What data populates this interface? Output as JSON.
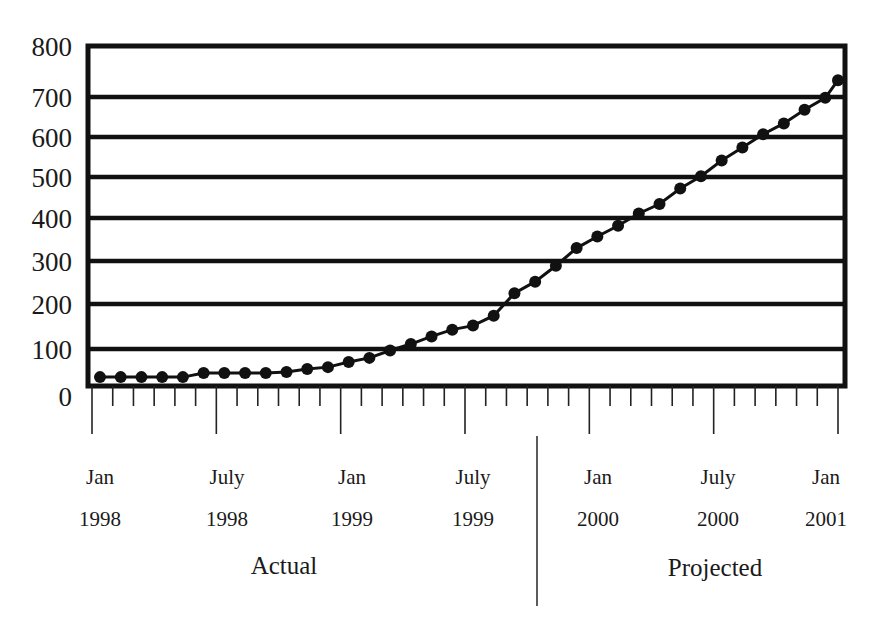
{
  "chart_data": {
    "type": "line",
    "title": "",
    "title_note": "Title cropped at top edge; illegible",
    "xlabel": "",
    "ylabel": "",
    "ylim": [
      0,
      800
    ],
    "yticks": [
      0,
      100,
      200,
      300,
      400,
      500,
      600,
      700,
      800
    ],
    "grid": "horizontal",
    "legend": null,
    "x_major_labels": [
      {
        "line1": "Jan",
        "line2": "1998"
      },
      {
        "line1": "July",
        "line2": "1998"
      },
      {
        "line1": "Jan",
        "line2": "1999"
      },
      {
        "line1": "July",
        "line2": "1999"
      },
      {
        "line1": "Jan",
        "line2": "2000"
      },
      {
        "line1": "July",
        "line2": "2000"
      },
      {
        "line1": "Jan",
        "line2": "2001"
      }
    ],
    "sections": [
      {
        "label": "Actual",
        "range": "Jan 1998 – Dec 1999"
      },
      {
        "label": "Projected",
        "range": "Jan 2000 – Jan 2001"
      }
    ],
    "series": [
      {
        "name": "Value",
        "x": [
          "Jan 1998",
          "Feb 1998",
          "Mar 1998",
          "Apr 1998",
          "May 1998",
          "Jun 1998",
          "Jul 1998",
          "Aug 1998",
          "Sep 1998",
          "Oct 1998",
          "Nov 1998",
          "Dec 1998",
          "Jan 1999",
          "Feb 1999",
          "Mar 1999",
          "Apr 1999",
          "May 1999",
          "Jun 1999",
          "Jul 1999",
          "Aug 1999",
          "Sep 1999",
          "Oct 1999",
          "Nov 1999",
          "Dec 1999",
          "Jan 2000",
          "Feb 2000",
          "Mar 2000",
          "Apr 2000",
          "May 2000",
          "Jun 2000",
          "Jul 2000",
          "Aug 2000",
          "Sep 2000",
          "Oct 2000",
          "Nov 2000",
          "Dec 2000",
          "Jan 2001"
        ],
        "values": [
          24,
          24,
          24,
          24,
          24,
          35,
          35,
          35,
          35,
          38,
          46,
          51,
          65,
          76,
          96,
          111,
          128,
          143,
          152,
          174,
          225,
          252,
          289,
          330,
          357,
          382,
          411,
          434,
          472,
          502,
          541,
          574,
          607,
          634,
          668,
          698,
          733
        ]
      }
    ]
  }
}
